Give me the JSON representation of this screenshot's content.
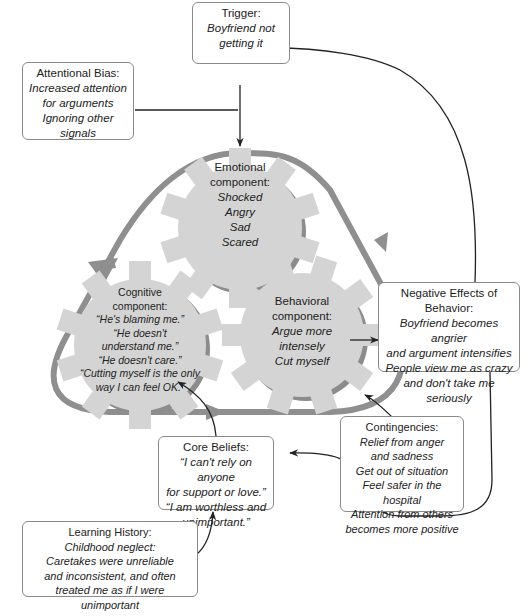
{
  "trigger": {
    "title": "Trigger:",
    "body": "Boyfriend not\ngetting it"
  },
  "attentional_bias": {
    "title": "Attentional Bias:",
    "body": "Increased attention\nfor arguments\nIgnoring other\nsignals"
  },
  "emotional": {
    "title": "Emotional\ncomponent:",
    "body": "Shocked\nAngry\nSad\nScared"
  },
  "cognitive": {
    "title": "Cognitive\ncomponent:",
    "body": "“He's blaming me.”\n“He doesn't\nunderstand me.”\n“He doesn't care.”\n“Cutting myself is the only\nway I can feel OK.”"
  },
  "behavioral": {
    "title": "Behavioral\ncomponent:",
    "body": "Argue more\nintensely\nCut myself"
  },
  "negative_effects": {
    "title": "Negative Effects\nof Behavior:",
    "body": "Boyfriend becomes angrier\nand argument intensifies\nPeople view me as crazy\nand don't take me seriously"
  },
  "contingencies": {
    "title": "Contingencies:",
    "body": "Relief from anger\nand sadness\nGet out of situation\nFeel safer in the hospital\nAttention from others\nbecomes more positive"
  },
  "core_beliefs": {
    "title": "Core Beliefs:",
    "body": "“I can't rely on anyone\nfor support or love.”\n“I am worthless and\nunimportant.”"
  },
  "learning_history": {
    "title": "Learning History:",
    "body": "Childhood neglect:\nCaretakes were unreliable\nand inconsistent, and often\ntreated me as if I were unimportant"
  },
  "colors": {
    "gear_fill": "#d4d4d4",
    "gear_shadow": "#8c8c8c",
    "cycle_stroke": "#8f8f8f",
    "arrow": "#222222"
  }
}
